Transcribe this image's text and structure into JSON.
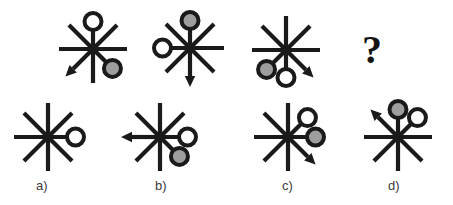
{
  "puzzle": {
    "type": "visual-analogy-matrix",
    "canvas": {
      "width": 453,
      "height": 205,
      "background": "#ffffff"
    },
    "colors": {
      "stroke": "#1a1a1a",
      "circle_white_fill": "#ffffff",
      "circle_gray_fill": "#9e9e9e",
      "label_text": "#3a3a3a",
      "question_mark": "#141414"
    },
    "style": {
      "spoke_stroke_width": 4.2,
      "circle_stroke_width": 4.0,
      "spoke_length": 34,
      "circle_radius": 8.5
    },
    "question_mark": {
      "glyph": "?",
      "x": 362,
      "y": 30
    },
    "prompt_row": {
      "name": "prompt-sequence",
      "figures": [
        {
          "id": "prompt-1",
          "center": {
            "x": 93,
            "y": 49
          },
          "spokes": [
            "N",
            "NE",
            "E",
            "SE",
            "S",
            "SW",
            "W",
            "NW"
          ],
          "arrows": [
            {
              "direction": "SW"
            }
          ],
          "markers": [
            {
              "direction": "N",
              "fill": "white"
            },
            {
              "direction": "SE",
              "fill": "gray"
            }
          ]
        },
        {
          "id": "prompt-2",
          "center": {
            "x": 190,
            "y": 48
          },
          "spokes": [
            "N",
            "NE",
            "E",
            "SE",
            "S",
            "SW",
            "W",
            "NW"
          ],
          "arrows": [
            {
              "direction": "S"
            }
          ],
          "markers": [
            {
              "direction": "N",
              "fill": "gray"
            },
            {
              "direction": "W",
              "fill": "white"
            }
          ]
        },
        {
          "id": "prompt-3",
          "center": {
            "x": 286,
            "y": 50
          },
          "spokes": [
            "N",
            "NE",
            "E",
            "SE",
            "S",
            "SW",
            "W",
            "NW"
          ],
          "arrows": [
            {
              "direction": "SE"
            }
          ],
          "markers": [
            {
              "direction": "SW",
              "fill": "gray"
            },
            {
              "direction": "S",
              "fill": "white"
            }
          ]
        },
        {
          "id": "prompt-4-missing",
          "center": {
            "x": 374,
            "y": 50
          },
          "spokes": [],
          "arrows": [],
          "markers": [],
          "is_question": true
        }
      ]
    },
    "options": [
      {
        "id": "option-a",
        "label": "a)",
        "label_pos": {
          "x": 36,
          "y": 178
        },
        "center": {
          "x": 48,
          "y": 137
        },
        "spokes": [
          "N",
          "NE",
          "E",
          "SE",
          "S",
          "SW",
          "W",
          "NW"
        ],
        "arrows": [],
        "markers": [
          {
            "direction": "E",
            "fill": "white"
          }
        ]
      },
      {
        "id": "option-b",
        "label": "b)",
        "label_pos": {
          "x": 155,
          "y": 178
        },
        "center": {
          "x": 160,
          "y": 137
        },
        "spokes": [
          "N",
          "NE",
          "E",
          "SE",
          "S",
          "SW",
          "W",
          "NW"
        ],
        "arrows": [
          {
            "direction": "W"
          }
        ],
        "markers": [
          {
            "direction": "E",
            "fill": "white"
          },
          {
            "direction": "SE",
            "fill": "gray"
          }
        ]
      },
      {
        "id": "option-c",
        "label": "c)",
        "label_pos": {
          "x": 282,
          "y": 178
        },
        "center": {
          "x": 288,
          "y": 137
        },
        "spokes": [
          "N",
          "NE",
          "E",
          "SE",
          "S",
          "SW",
          "W",
          "NW"
        ],
        "arrows": [
          {
            "direction": "SE"
          }
        ],
        "markers": [
          {
            "direction": "NE",
            "fill": "white"
          },
          {
            "direction": "E",
            "fill": "gray"
          }
        ]
      },
      {
        "id": "option-d",
        "label": "d)",
        "label_pos": {
          "x": 388,
          "y": 178
        },
        "center": {
          "x": 398,
          "y": 137
        },
        "spokes": [
          "N",
          "NE",
          "E",
          "SE",
          "S",
          "SW",
          "W",
          "NW"
        ],
        "arrows": [
          {
            "direction": "NW"
          }
        ],
        "markers": [
          {
            "direction": "N",
            "fill": "gray"
          },
          {
            "direction": "NE",
            "fill": "white"
          }
        ]
      }
    ]
  }
}
